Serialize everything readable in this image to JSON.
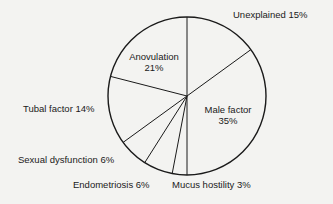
{
  "chart_data": {
    "type": "pie",
    "title": "",
    "start_angle_deg": 0,
    "direction": "clockwise",
    "slices": [
      {
        "label": "Unexplained",
        "value": 15,
        "display": "Unexplained 15%"
      },
      {
        "label": "Male factor",
        "value": 35,
        "display": "Male factor 35%"
      },
      {
        "label": "Mucus hostility",
        "value": 3,
        "display": "Mucus hostility 3%"
      },
      {
        "label": "Endometriosis",
        "value": 6,
        "display": "Endometriosis 6%"
      },
      {
        "label": "Sexual dysfunction",
        "value": 6,
        "display": "Sexual dysfunction 6%"
      },
      {
        "label": "Tubal factor",
        "value": 14,
        "display": "Tubal factor 14%"
      },
      {
        "label": "Anovulation",
        "value": 21,
        "display": "Anovulation 21%"
      }
    ],
    "categories": [
      "Unexplained",
      "Male factor",
      "Mucus hostility",
      "Endometriosis",
      "Sexual dysfunction",
      "Tubal factor",
      "Anovulation"
    ],
    "values": [
      15,
      35,
      3,
      6,
      6,
      14,
      21
    ],
    "unit": "%",
    "legend": "none (labels placed around slices)"
  },
  "labels": {
    "unexplained": "Unexplained 15%",
    "male_line1": "Male factor",
    "male_line2": "35%",
    "anovulation_line1": "Anovulation",
    "anovulation_line2": "21%",
    "tubal": "Tubal factor 14%",
    "sexual": "Sexual dysfunction 6%",
    "endometriosis": "Endometriosis 6%",
    "mucus": "Mucus hostility 3%"
  },
  "style": {
    "stroke": "#1a1a1a",
    "fill": "none",
    "background": "#f3f3f1"
  }
}
